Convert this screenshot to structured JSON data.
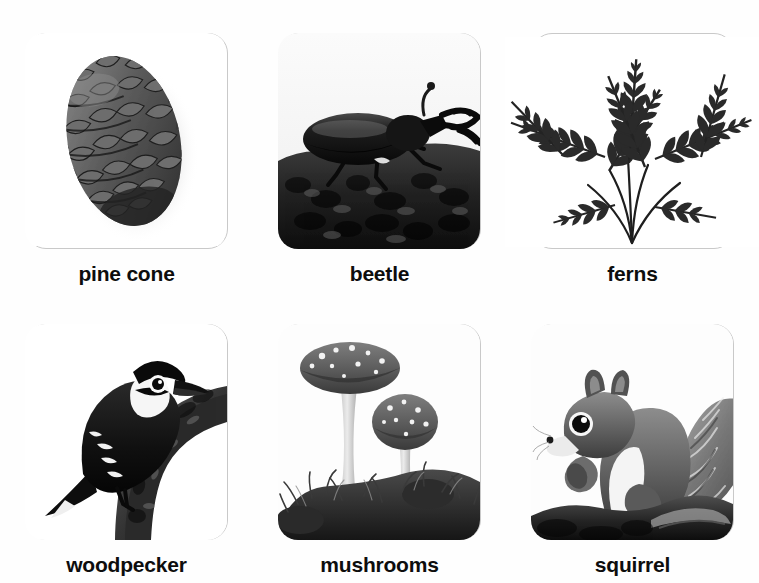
{
  "page": {
    "background_color": "#ffffff",
    "layout": "2 rows x 3 columns picture-card grid",
    "card_border_color": "#c9c9c9",
    "label_color": "#0d0d0d"
  },
  "cards": [
    {
      "id": "pine-cone",
      "label": "pine cone",
      "image_subject": "pine cone",
      "image_style": "black-and-white photo on white background with drop shadow",
      "fills_card": false
    },
    {
      "id": "beetle",
      "label": "beetle",
      "image_subject": "stag beetle on a tree stump",
      "image_style": "black-and-white photo filling the whole card",
      "fills_card": true
    },
    {
      "id": "ferns",
      "label": "ferns",
      "image_subject": "fern fronds",
      "image_style": "black-and-white photo on white background, fronds extend past card edges",
      "fills_card": false
    },
    {
      "id": "woodpecker",
      "label": "woodpecker",
      "image_subject": "woodpecker perched on a tree branch",
      "image_style": "black-and-white photo on white background",
      "fills_card": false
    },
    {
      "id": "mushrooms",
      "label": "mushrooms",
      "image_subject": "two spotted mushrooms growing in moss",
      "image_style": "black-and-white photo on white background",
      "fills_card": false
    },
    {
      "id": "squirrel",
      "label": "squirrel",
      "image_subject": "squirrel eating a nut on a log",
      "image_style": "black-and-white photo on white background",
      "fills_card": false
    }
  ]
}
